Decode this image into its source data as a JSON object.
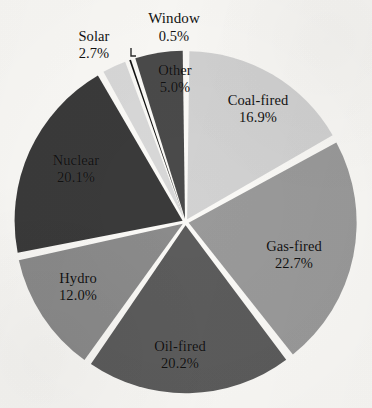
{
  "chart_data": {
    "type": "pie",
    "title": "",
    "subtitle": "",
    "xlabel": "",
    "ylabel": "",
    "legend_position": "none",
    "grid": false,
    "units": "percent",
    "total": 100.1,
    "start_angle_deg": 0,
    "direction": "clockwise",
    "exploded": true,
    "categories": [
      "Coal-fired",
      "Gas-fired",
      "Oil-fired",
      "Hydro",
      "Nuclear",
      "Solar",
      "Window",
      "Other"
    ],
    "values": [
      16.9,
      22.7,
      20.2,
      12.0,
      20.1,
      2.7,
      0.5,
      5.0
    ],
    "slices": [
      {
        "name": "Coal-fired",
        "value": 16.9,
        "label": "Coal-fired",
        "value_label": "16.9%",
        "color": "#d2d2d2",
        "text_color": "#111111",
        "label_inside": true,
        "leader_line": false
      },
      {
        "name": "Gas-fired",
        "value": 22.7,
        "label": "Gas-fired",
        "value_label": "22.7%",
        "color": "#9a9a9a",
        "text_color": "#111111",
        "label_inside": true,
        "leader_line": false
      },
      {
        "name": "Oil-fired",
        "value": 20.2,
        "label": "Oil-fired",
        "value_label": "20.2%",
        "color": "#5c5c5c",
        "text_color": "#111111",
        "label_inside": true,
        "leader_line": false
      },
      {
        "name": "Hydro",
        "value": 12.0,
        "label": "Hydro",
        "value_label": "12.0%",
        "color": "#8b8b8b",
        "text_color": "#111111",
        "label_inside": true,
        "leader_line": false
      },
      {
        "name": "Nuclear",
        "value": 20.1,
        "label": "Nuclear",
        "value_label": "20.1%",
        "color": "#3a3a3a",
        "text_color": "#0a0a0a",
        "label_inside": true,
        "leader_line": false
      },
      {
        "name": "Solar",
        "value": 2.7,
        "label": "Solar",
        "value_label": "2.7%",
        "color": "#d8d8d8",
        "text_color": "#111111",
        "label_inside": false,
        "leader_line": false
      },
      {
        "name": "Window",
        "value": 0.5,
        "label": "Window",
        "value_label": "0.5%",
        "color": "#101010",
        "text_color": "#111111",
        "label_inside": false,
        "leader_line": true
      },
      {
        "name": "Other",
        "value": 5.0,
        "label": "Other",
        "value_label": "5.0%",
        "color": "#4a4a4a",
        "text_color": "#0d0d0d",
        "label_inside": true,
        "leader_line": false
      }
    ],
    "colors": {
      "background": "#fbfaf7",
      "separator": "#ffffff",
      "text": "#111111",
      "leader_line": "#2a2a2a"
    }
  }
}
